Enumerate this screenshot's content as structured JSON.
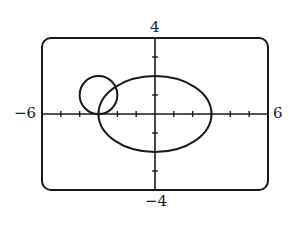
{
  "chart_data": {
    "type": "line",
    "title": "",
    "xlabel": "",
    "ylabel": "",
    "xlim": [
      -6,
      6
    ],
    "ylim": [
      -4,
      4
    ],
    "grid": false,
    "x_tick_step": 1,
    "y_tick_values": [
      -3,
      -1,
      1,
      3
    ],
    "window_labels": {
      "xmin": "−6",
      "xmax": "6",
      "ymin": "−4",
      "ymax": "4"
    },
    "series": [
      {
        "name": "circle",
        "equation": "(x+3)^2 + (y-1)^2 = 1",
        "center": [
          -3,
          1
        ],
        "radius": 1
      },
      {
        "name": "ellipse",
        "equation": "x^2/9 + y^2/4 = 1",
        "center": [
          0,
          0
        ],
        "semi_axes": [
          3,
          2
        ]
      }
    ],
    "colors": {
      "stroke": "#1a1a1a",
      "background": "#ffffff"
    }
  }
}
